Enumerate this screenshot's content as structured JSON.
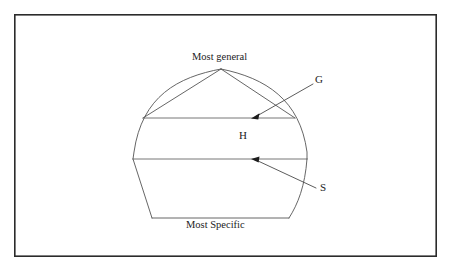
{
  "figure": {
    "kind": "version-space-diagram",
    "background_color": "#ffffff",
    "frame": {
      "stroke_color": "#2b2b2b",
      "x": 14,
      "y": 14,
      "width": 423,
      "height": 243
    },
    "labels": {
      "most_general": "Most general",
      "most_specific": "Most Specific",
      "hypothesis_space": "H",
      "general_boundary": "G",
      "specific_boundary": "S"
    },
    "geometry": {
      "apex": {
        "x": 221,
        "y": 69
      },
      "g_line": {
        "x1": 143,
        "y1": 118,
        "x2": 295,
        "y2": 118
      },
      "s_line": {
        "x1": 133,
        "y1": 159,
        "x2": 307,
        "y2": 159
      },
      "bottom_line": {
        "x1": 152,
        "y1": 218,
        "x2": 289,
        "y2": 218
      },
      "left_widest_x": 133,
      "right_widest_x": 307,
      "widest_y": 159
    },
    "annotations": [
      {
        "name": "g-leader",
        "label": "G",
        "from": {
          "x": 313,
          "y": 84
        },
        "to": {
          "x": 252,
          "y": 118
        }
      },
      {
        "name": "s-leader",
        "label": "S",
        "from": {
          "x": 316,
          "y": 188
        },
        "to": {
          "x": 252,
          "y": 159
        }
      }
    ],
    "colors": {
      "frame": "#2b2b2b",
      "outline": "#555555",
      "boundary": "#666666",
      "leader": "#4a4a4a",
      "arrowhead": "#1c1c1c",
      "text": "#1c1c1c"
    }
  }
}
